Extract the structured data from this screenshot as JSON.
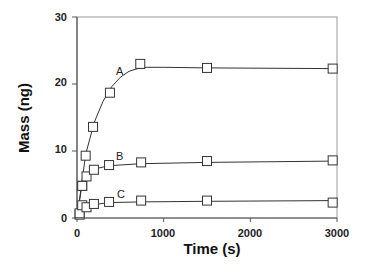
{
  "chart_data": {
    "type": "line",
    "title": "",
    "xlabel": "Time (s)",
    "ylabel": "Mass (ng)",
    "xlim": [
      0,
      3000
    ],
    "ylim": [
      0,
      30
    ],
    "xticks": [
      0,
      1000,
      2000,
      3000
    ],
    "yticks": [
      0,
      10,
      20,
      30
    ],
    "grid": false,
    "legend": "inline labels A, B, C",
    "marker": "open-square",
    "series": [
      {
        "name": "A",
        "x": [
          30,
          60,
          100,
          185,
          380,
          730,
          1500,
          2950
        ],
        "values": [
          0.5,
          4.8,
          9.3,
          13.6,
          18.7,
          23.0,
          22.4,
          22.3
        ],
        "fit": [
          [
            0,
            0
          ],
          [
            100,
            9.5
          ],
          [
            200,
            14.3
          ],
          [
            300,
            17.4
          ],
          [
            400,
            19.6
          ],
          [
            500,
            21.0
          ],
          [
            600,
            21.9
          ],
          [
            700,
            22.3
          ],
          [
            800,
            22.5
          ],
          [
            1000,
            22.5
          ],
          [
            1500,
            22.4
          ],
          [
            2950,
            22.3
          ]
        ]
      },
      {
        "name": "B",
        "x": [
          60,
          110,
          195,
          370,
          740,
          1500,
          2950
        ],
        "values": [
          4.8,
          6.2,
          7.2,
          7.9,
          8.3,
          8.5,
          8.6
        ],
        "fit": [
          [
            0,
            0
          ],
          [
            60,
            5.2
          ],
          [
            110,
            6.5
          ],
          [
            195,
            7.3
          ],
          [
            370,
            7.8
          ],
          [
            740,
            8.1
          ],
          [
            1500,
            8.3
          ],
          [
            2950,
            8.5
          ]
        ]
      },
      {
        "name": "C",
        "x": [
          30,
          60,
          110,
          195,
          370,
          740,
          1500,
          2950
        ],
        "values": [
          0.7,
          1.9,
          1.6,
          2.1,
          2.4,
          2.6,
          2.6,
          2.3
        ],
        "fit": [
          [
            0,
            0
          ],
          [
            60,
            1.5
          ],
          [
            110,
            1.8
          ],
          [
            195,
            2.0
          ],
          [
            370,
            2.3
          ],
          [
            740,
            2.4
          ],
          [
            1500,
            2.5
          ],
          [
            2950,
            2.6
          ]
        ]
      }
    ]
  },
  "axes": {
    "x_title": "Time (s)",
    "y_title": "Mass (ng)",
    "x_tick_labels": [
      "0",
      "1000",
      "2000",
      "3000"
    ],
    "y_tick_labels": [
      "0",
      "10",
      "20",
      "30"
    ]
  },
  "labels": {
    "A": "A",
    "B": "B",
    "C": "C"
  }
}
